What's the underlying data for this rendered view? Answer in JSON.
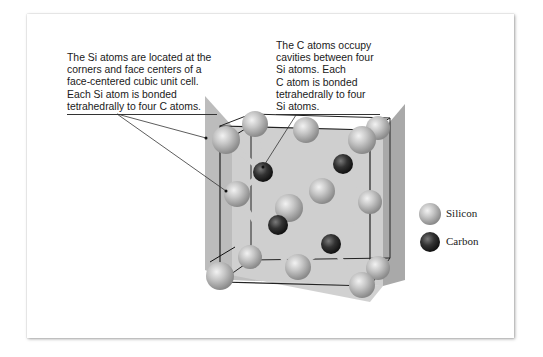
{
  "figure": {
    "captions": {
      "silicon": {
        "lines": [
          "The Si atoms are located at the",
          "corners and face centers of a",
          "face-centered cubic unit cell.",
          "Each Si atom is bonded",
          "tetrahedrally to four C atoms."
        ]
      },
      "carbon": {
        "lines": [
          "The C atoms occupy",
          "cavities between four",
          "Si atoms. Each",
          "C atom is bonded",
          "tetrahedrally to four",
          "Si atoms."
        ]
      }
    },
    "legend": {
      "items": [
        {
          "label": "Silicon",
          "color": "#b8b8b8",
          "icon": "silicon-atom-icon"
        },
        {
          "label": "Carbon",
          "color": "#2e2e2e",
          "icon": "carbon-atom-icon"
        }
      ]
    },
    "colors": {
      "silicon": "#b8b8b8",
      "carbon": "#2e2e2e",
      "cube_face": "#c4c4c4",
      "cube_edge": "#222222",
      "bond": "#c8c8c8"
    }
  }
}
